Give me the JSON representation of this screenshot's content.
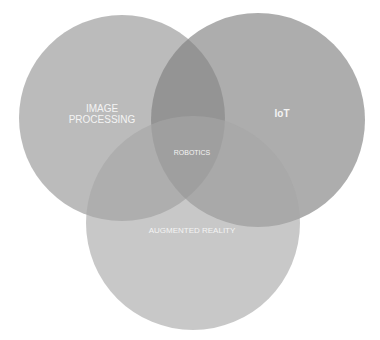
{
  "diagram": {
    "type": "venn",
    "sets": [
      {
        "id": "image_processing",
        "label_line1": "IMAGE",
        "label_line2": "PROCESSING",
        "cx": 122,
        "cy": 118,
        "r": 103,
        "color": "#b8b8b8"
      },
      {
        "id": "iot",
        "label": "IoT",
        "cx": 258,
        "cy": 120,
        "r": 107,
        "color": "#a9a9a9"
      },
      {
        "id": "augmented_reality",
        "label": "AUGMENTED REALITY",
        "cx": 193,
        "cy": 223,
        "r": 107,
        "color": "#c2c2c2"
      }
    ],
    "intersection": {
      "label": "ROBOTICS"
    },
    "colors": {
      "background": "#ffffff",
      "text": "#f4f4f4"
    }
  }
}
